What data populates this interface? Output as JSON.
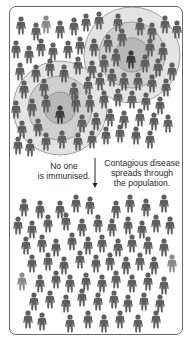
{
  "figure": {
    "captions": {
      "left": [
        "No one",
        "is immunised."
      ],
      "right": [
        "Contagious disease",
        "spreads through",
        "the population."
      ]
    },
    "arrow": {
      "x": 95,
      "y1": 158,
      "y2": 188,
      "direction": "down"
    },
    "colors": {
      "background": "#ffffff",
      "frame": "#6a6a6a",
      "person": "#5e5e5e",
      "person_light": "#8a8a8a",
      "infected": "#3a3a3a",
      "ring_inner": "#b8b8b8",
      "ring_middle": "#cfcfcf",
      "ring_outer": "#e4e4e4",
      "ring_stroke": "#8c8c8c",
      "text": "#2a2a2a"
    },
    "infection_zones": [
      {
        "cx": 132,
        "cy": 55,
        "radii": [
          48,
          33,
          17
        ],
        "infected_person": [
          131,
          52
        ]
      },
      {
        "cx": 60,
        "cy": 108,
        "radii": [
          47,
          32,
          16
        ],
        "infected_person": [
          60,
          107
        ]
      }
    ],
    "top_crowd": [
      [
        21,
        18
      ],
      [
        36,
        24
      ],
      [
        46,
        17
      ],
      [
        60,
        22
      ],
      [
        74,
        19
      ],
      [
        86,
        15
      ],
      [
        99,
        13
      ],
      [
        118,
        15
      ],
      [
        140,
        19
      ],
      [
        152,
        24
      ],
      [
        165,
        17
      ],
      [
        177,
        22
      ],
      [
        16,
        42
      ],
      [
        29,
        47
      ],
      [
        41,
        40
      ],
      [
        53,
        44
      ],
      [
        68,
        42
      ],
      [
        80,
        38
      ],
      [
        94,
        40
      ],
      [
        108,
        36
      ],
      [
        122,
        30
      ],
      [
        150,
        40
      ],
      [
        163,
        44
      ],
      [
        20,
        64
      ],
      [
        36,
        66
      ],
      [
        50,
        60
      ],
      [
        64,
        66
      ],
      [
        78,
        58
      ],
      [
        92,
        62
      ],
      [
        104,
        56
      ],
      [
        116,
        50
      ],
      [
        145,
        56
      ],
      [
        158,
        60
      ],
      [
        172,
        64
      ],
      [
        24,
        82
      ],
      [
        44,
        80
      ],
      [
        74,
        84
      ],
      [
        88,
        78
      ],
      [
        100,
        74
      ],
      [
        112,
        70
      ],
      [
        124,
        74
      ],
      [
        138,
        74
      ],
      [
        152,
        76
      ],
      [
        166,
        80
      ],
      [
        16,
        102
      ],
      [
        32,
        100
      ],
      [
        46,
        96
      ],
      [
        76,
        96
      ],
      [
        90,
        96
      ],
      [
        104,
        92
      ],
      [
        118,
        90
      ],
      [
        132,
        92
      ],
      [
        146,
        94
      ],
      [
        160,
        98
      ],
      [
        22,
        122
      ],
      [
        38,
        120
      ],
      [
        82,
        116
      ],
      [
        96,
        114
      ],
      [
        110,
        110
      ],
      [
        124,
        112
      ],
      [
        140,
        110
      ],
      [
        154,
        114
      ],
      [
        168,
        116
      ],
      [
        18,
        138
      ],
      [
        30,
        140
      ],
      [
        46,
        134
      ],
      [
        62,
        132
      ],
      [
        78,
        134
      ],
      [
        92,
        132
      ],
      [
        106,
        128
      ],
      [
        120,
        126
      ],
      [
        136,
        128
      ],
      [
        150,
        132
      ]
    ],
    "bottom_crowd": [
      [
        24,
        200
      ],
      [
        40,
        202
      ],
      [
        60,
        202
      ],
      [
        76,
        196
      ],
      [
        90,
        198
      ],
      [
        116,
        202
      ],
      [
        130,
        196
      ],
      [
        146,
        200
      ],
      [
        164,
        196
      ],
      [
        18,
        218
      ],
      [
        32,
        222
      ],
      [
        48,
        216
      ],
      [
        66,
        214
      ],
      [
        82,
        220
      ],
      [
        98,
        216
      ],
      [
        112,
        220
      ],
      [
        128,
        218
      ],
      [
        142,
        222
      ],
      [
        156,
        216
      ],
      [
        170,
        218
      ],
      [
        26,
        238
      ],
      [
        42,
        236
      ],
      [
        56,
        240
      ],
      [
        72,
        234
      ],
      [
        88,
        238
      ],
      [
        102,
        236
      ],
      [
        118,
        240
      ],
      [
        132,
        236
      ],
      [
        148,
        238
      ],
      [
        164,
        240
      ],
      [
        32,
        256
      ],
      [
        48,
        254
      ],
      [
        64,
        258
      ],
      [
        80,
        252
      ],
      [
        96,
        256
      ],
      [
        110,
        254
      ],
      [
        126,
        258
      ],
      [
        140,
        254
      ],
      [
        154,
        258
      ],
      [
        172,
        256
      ],
      [
        22,
        274
      ],
      [
        40,
        276
      ],
      [
        56,
        272
      ],
      [
        70,
        276
      ],
      [
        86,
        274
      ],
      [
        102,
        276
      ],
      [
        116,
        272
      ],
      [
        132,
        276
      ],
      [
        148,
        274
      ],
      [
        164,
        278
      ],
      [
        34,
        294
      ],
      [
        50,
        292
      ],
      [
        66,
        296
      ],
      [
        82,
        290
      ],
      [
        98,
        294
      ],
      [
        114,
        292
      ],
      [
        128,
        296
      ],
      [
        144,
        294
      ],
      [
        160,
        296
      ],
      [
        28,
        312
      ],
      [
        42,
        314
      ],
      [
        70,
        316
      ],
      [
        88,
        312
      ],
      [
        104,
        316
      ],
      [
        120,
        312
      ],
      [
        138,
        316
      ],
      [
        156,
        312
      ]
    ],
    "light_people": [
      [
        46,
        17
      ],
      [
        174,
        22
      ],
      [
        28,
        200
      ],
      [
        22,
        274
      ],
      [
        160,
        240
      ],
      [
        172,
        256
      ]
    ]
  }
}
